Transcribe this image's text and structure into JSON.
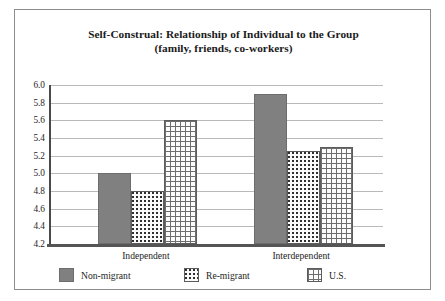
{
  "chart_data": {
    "type": "bar",
    "title": "Self-Construal: Relationship of Individual to the Group (family, friends, co-workers)",
    "title_lines": [
      "Self-Construal: Relationship of Individual to the Group",
      "(family, friends, co-workers)"
    ],
    "xlabel": "",
    "ylabel": "",
    "categories": [
      "Independent",
      "Interdependent"
    ],
    "series": [
      {
        "name": "Non-migrant",
        "values": [
          5.0,
          5.9
        ],
        "color": "#808080",
        "pattern": "solid-gray"
      },
      {
        "name": "Re-migrant",
        "values": [
          4.8,
          5.25
        ],
        "color": "#fbfbfb",
        "pattern": "dotted"
      },
      {
        "name": "U.S.",
        "values": [
          5.6,
          5.3
        ],
        "color": "#fcfcfc",
        "pattern": "grid"
      }
    ],
    "ylim": [
      4.2,
      6.0
    ],
    "ytick_step": 0.2,
    "yticks": [
      "6.0",
      "5.8",
      "5.6",
      "5.4",
      "5.2",
      "5.0",
      "4.8",
      "4.6",
      "4.4",
      "4.2"
    ],
    "grid": true,
    "legend_position": "bottom"
  }
}
